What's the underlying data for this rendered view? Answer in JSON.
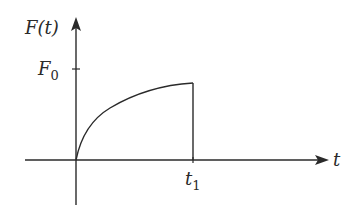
{
  "diagram": {
    "y_axis": {
      "label_main": "F(t)"
    },
    "x_axis": {
      "label_main": "t"
    },
    "ticks": {
      "y": {
        "main": "F",
        "sub": "0"
      },
      "x": {
        "main": "t",
        "sub": "1"
      }
    },
    "colors": {
      "stroke": "#2a2a2a",
      "background": "#ffffff"
    }
  }
}
